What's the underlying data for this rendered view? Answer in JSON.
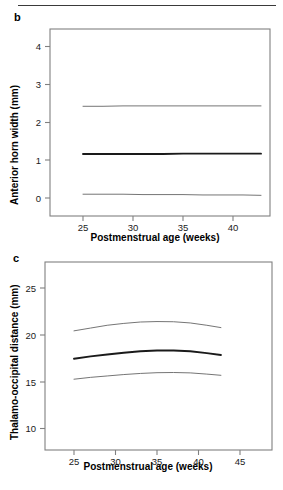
{
  "figure": {
    "background_color": "#ffffff",
    "rule_color": "#3a3a3a",
    "axis_color": "#808080",
    "median_line_color": "#1a1a1a",
    "percentile_line_color": "#6e6e6e"
  },
  "panels": [
    {
      "letter": "b",
      "ylabel": "Anterior horn width (mm)",
      "xlabel": "Postmenstrual age (weeks)",
      "yticks": [
        "0",
        "1",
        "2",
        "3",
        "4"
      ],
      "xticks": [
        "25",
        "30",
        "35",
        "40"
      ]
    },
    {
      "letter": "c",
      "ylabel": "Thalamo-occipital distance (mm)",
      "xlabel": "Postmenstrual age (weeks)",
      "yticks": [
        "10",
        "15",
        "20",
        "25"
      ],
      "xticks": [
        "25",
        "30",
        "35",
        "40",
        "45"
      ]
    }
  ],
  "chart_data": [
    {
      "type": "line",
      "panel": "b",
      "title": "",
      "xlabel": "Postmenstrual age (weeks)",
      "ylabel": "Anterior horn width (mm)",
      "xlim": [
        22.4,
        44.6
      ],
      "ylim": [
        -0.55,
        4.45
      ],
      "xticks": [
        25,
        30,
        35,
        40
      ],
      "yticks": [
        0,
        1,
        2,
        3,
        4
      ],
      "grid": false,
      "legend": "none",
      "x": [
        25,
        27,
        29,
        31,
        33,
        35,
        37,
        39,
        41,
        42.8
      ],
      "series": [
        {
          "name": "upper centile",
          "style": "thin",
          "values": [
            2.42,
            2.42,
            2.43,
            2.43,
            2.43,
            2.43,
            2.43,
            2.43,
            2.43,
            2.43
          ]
        },
        {
          "name": "median",
          "style": "bold",
          "values": [
            1.16,
            1.16,
            1.16,
            1.16,
            1.16,
            1.17,
            1.17,
            1.17,
            1.17,
            1.17
          ]
        },
        {
          "name": "lower centile",
          "style": "thin",
          "values": [
            0.1,
            0.1,
            0.1,
            0.09,
            0.09,
            0.09,
            0.08,
            0.08,
            0.08,
            0.07
          ]
        }
      ]
    },
    {
      "type": "line",
      "panel": "c",
      "title": "",
      "xlabel": "Postmenstrual age (weeks)",
      "ylabel": "Thalamo-occipital distance (mm)",
      "xlim": [
        22.2,
        48.6
      ],
      "ylim": [
        7.7,
        27.6
      ],
      "xticks": [
        25,
        30,
        35,
        40,
        45
      ],
      "yticks": [
        10,
        15,
        20,
        25
      ],
      "grid": false,
      "legend": "none",
      "x": [
        25,
        27,
        29,
        31,
        33,
        35,
        37,
        39,
        41,
        42.7
      ],
      "series": [
        {
          "name": "upper centile",
          "style": "thin",
          "values": [
            20.5,
            20.8,
            21.1,
            21.3,
            21.45,
            21.5,
            21.48,
            21.35,
            21.1,
            20.85
          ]
        },
        {
          "name": "median",
          "style": "bold",
          "values": [
            17.5,
            17.75,
            17.95,
            18.15,
            18.3,
            18.38,
            18.38,
            18.3,
            18.1,
            17.9
          ]
        },
        {
          "name": "lower centile",
          "style": "thin",
          "values": [
            15.3,
            15.5,
            15.65,
            15.8,
            15.92,
            16.0,
            16.02,
            15.98,
            15.85,
            15.72
          ]
        }
      ]
    }
  ]
}
